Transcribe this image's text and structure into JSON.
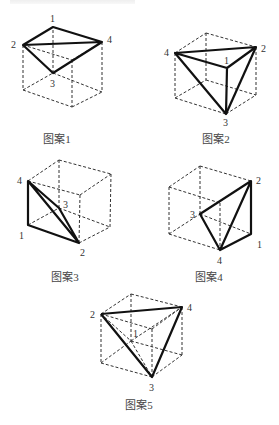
{
  "figures": [
    {
      "caption": "图案1",
      "labels": {
        "v1": "1",
        "v2": "2",
        "v3": "3",
        "v4": "4"
      }
    },
    {
      "caption": "图案2",
      "labels": {
        "v1": "1",
        "v2": "2",
        "v3": "3",
        "v4": "4"
      }
    },
    {
      "caption": "图案3",
      "labels": {
        "v1": "1",
        "v2": "2",
        "v3": "3",
        "v4": "4"
      }
    },
    {
      "caption": "图案4",
      "labels": {
        "v1": "1",
        "v2": "2",
        "v3": "3",
        "v4": "4"
      }
    },
    {
      "caption": "图案5",
      "labels": {
        "v1": "1",
        "v2": "2",
        "v3": "3",
        "v4": "4"
      }
    }
  ]
}
